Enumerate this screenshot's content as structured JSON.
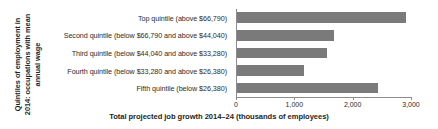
{
  "chart_data": {
    "type": "bar",
    "orientation": "horizontal",
    "title": "",
    "xlabel": "Total projected job growth 2014–24 (thousands of employees)",
    "ylabel_lines": [
      "Quintiles of employment in",
      "2014: occupations with mean",
      "annual wage"
    ],
    "ylabel": "Quintiles of employment in 2014: occupations with mean annual wage",
    "categories": [
      "Top quintile (above $66,790)",
      "Second quintile (below $66,790 and above $44,040)",
      "Third quintile (below $44,040 and above $33,280)",
      "Fourth quintile (below $33,280 and above $26,380)",
      "Fifth quintile (below $26,380)"
    ],
    "values": [
      2900,
      1660,
      1550,
      1150,
      2420
    ],
    "xlim": [
      0,
      3000
    ],
    "xticks": [
      0,
      1000,
      2000,
      3000
    ],
    "xtick_labels": [
      "0",
      "1,000",
      "2,000",
      "3,000"
    ],
    "grid": false,
    "legend": false,
    "bar_color": "#7a7a7a",
    "axis_color": "#8c8c8c"
  }
}
